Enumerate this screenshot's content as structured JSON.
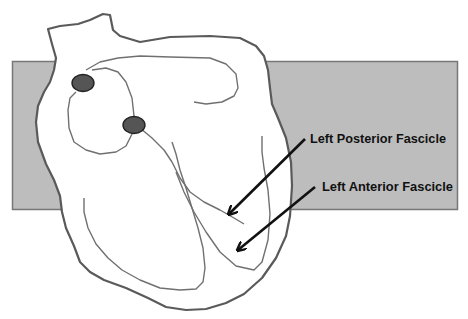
{
  "diagram": {
    "background_box_color": "#bdbdbd",
    "outline_color": "#5a5a5a",
    "node_color": "#555555",
    "arrow_color": "#111111",
    "labels": {
      "posterior": "Left Posterior Fascicle",
      "anterior": "Left Anterior Fascicle"
    },
    "nodes": [
      {
        "name": "sinoatrial-node",
        "cx": 83,
        "cy": 83
      },
      {
        "name": "atrioventricular-node",
        "cx": 134,
        "cy": 125
      }
    ]
  }
}
